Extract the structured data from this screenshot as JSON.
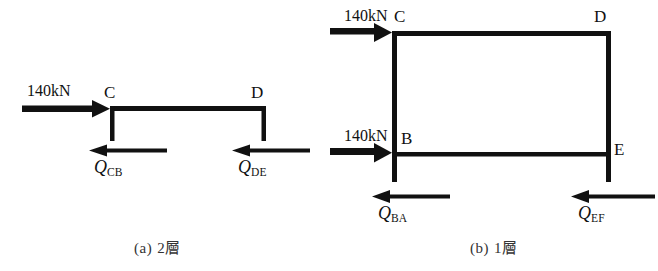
{
  "figure": {
    "background_color": "#ffffff",
    "ink_color": "#111111",
    "panels": [
      {
        "id": "a",
        "caption_index": "(a)",
        "caption_text": "2層",
        "joints": [
          {
            "name": "C",
            "label": "C"
          },
          {
            "name": "D",
            "label": "D"
          }
        ],
        "applied_forces": [
          {
            "name": "horizontal-load-c",
            "label": "140kN",
            "direction": "right",
            "at_joint": "C"
          }
        ],
        "shear_forces": [
          {
            "name": "shear-cb",
            "symbol": "Q",
            "subscript": "CB",
            "direction": "left"
          },
          {
            "name": "shear-de",
            "symbol": "Q",
            "subscript": "DE",
            "direction": "left"
          }
        ]
      },
      {
        "id": "b",
        "caption_index": "(b)",
        "caption_text": "1層",
        "joints": [
          {
            "name": "C",
            "label": "C"
          },
          {
            "name": "D",
            "label": "D"
          },
          {
            "name": "B",
            "label": "B"
          },
          {
            "name": "E",
            "label": "E"
          }
        ],
        "applied_forces": [
          {
            "name": "horizontal-load-c",
            "label": "140kN",
            "direction": "right",
            "at_joint": "C"
          },
          {
            "name": "horizontal-load-b",
            "label": "140kN",
            "direction": "right",
            "at_joint": "B"
          }
        ],
        "shear_forces": [
          {
            "name": "shear-ba",
            "symbol": "Q",
            "subscript": "BA",
            "direction": "left"
          },
          {
            "name": "shear-ef",
            "symbol": "Q",
            "subscript": "EF",
            "direction": "left"
          }
        ]
      }
    ]
  }
}
